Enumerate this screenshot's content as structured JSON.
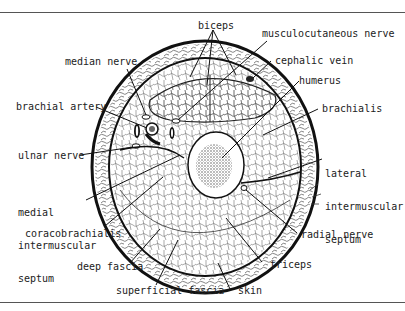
{
  "figure": {
    "labels": {
      "biceps": "biceps",
      "musculocutaneous_nerve": "musculocutaneous nerve",
      "median_nerve": "median nerve",
      "cephalic_vein": "cephalic vein",
      "humerus": "humerus",
      "brachial_artery": "brachial artery",
      "brachialis": "brachialis",
      "ulnar_nerve": "ulnar nerve",
      "lateral_intermuscular_septum": [
        "lateral",
        "intermuscular",
        "septum"
      ],
      "medial_intermuscular_septum": [
        "medial",
        "intermuscular",
        "septum"
      ],
      "coracobrachialis": "coracobrachialis",
      "radial_nerve": "radial nerve",
      "triceps": "triceps",
      "deep_fascia": "deep fascia",
      "superficial_fascia": "superficial fascia",
      "skin": "skin"
    },
    "colors": {
      "ink": "#1a1a1a",
      "text": "#222222",
      "rule": "#555555",
      "background": "#ffffff"
    }
  }
}
